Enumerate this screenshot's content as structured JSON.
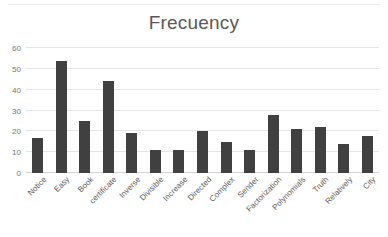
{
  "chart_data": {
    "type": "bar",
    "title": "Frecuency",
    "xlabel": "",
    "ylabel": "",
    "ylim": [
      0,
      60
    ],
    "yticks": [
      0,
      10,
      20,
      30,
      40,
      50,
      60
    ],
    "grid": true,
    "legend": "none",
    "bar_color": "#404040",
    "gridline_color": "#e4e6e8",
    "title_color": "#595959",
    "categories": [
      "Notice",
      "Easy",
      "Book",
      "certificate",
      "Inverse",
      "Divisible",
      "Increase",
      "Directed",
      "Complex",
      "Sender",
      "Factorization",
      "Polynomials",
      "Truth",
      "Relatively",
      "City"
    ],
    "values": [
      17,
      54,
      25,
      44,
      19,
      11,
      11,
      20,
      15,
      11,
      28,
      21,
      22,
      14,
      18
    ]
  }
}
